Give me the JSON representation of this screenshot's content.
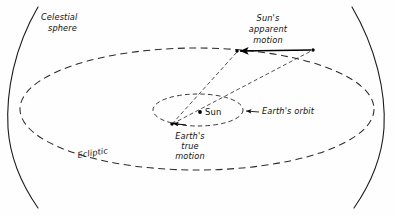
{
  "figure": {
    "width": 394,
    "height": 215,
    "background_color": "#fefefe",
    "line_color": "#1a1a1a"
  },
  "labels": {
    "celestial_sphere_line1": "Celestial",
    "celestial_sphere_line2": "sphere",
    "suns_apparent_motion_line1": "Sun's",
    "suns_apparent_motion_line2": "apparent",
    "suns_apparent_motion_line3": "motion",
    "earths_orbit": "Earth's orbit",
    "sun": "Sun",
    "earths_true_motion_line1": "Earth's",
    "earths_true_motion_line2": "true",
    "earths_true_motion_line3": "motion",
    "ecliptic": "Ecliptic"
  },
  "elements": {
    "celestial_sphere_left_arc": "solid arc",
    "celestial_sphere_right_arc": "solid arc",
    "ecliptic_ellipse": "large dashed ellipse",
    "earth_orbit_ellipse": "small dashed ellipse",
    "sun_marker": "filled dot at center of Earth's orbit",
    "earth_marker": "filled dot on Earth's orbit",
    "sight_line_1": "dashed line from Earth through Sun to celestial sphere",
    "sight_line_2": "dashed line from Earth to celestial sphere",
    "apparent_motion_arrow": "solid arrow along celestial sphere ecliptic pointing left",
    "true_motion_arrow": "small solid arrow at Earth pointing left",
    "earth_orbit_pointer": "small arrow pointing left toward Earth's orbit ellipse"
  }
}
